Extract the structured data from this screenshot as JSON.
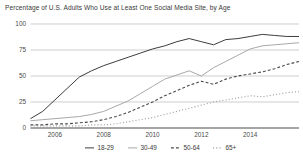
{
  "chart_data": {
    "type": "line",
    "title": "Percentage of U.S. Adults Who Use at Least One Social Media Site, by Age",
    "xlabel": "",
    "ylabel": "",
    "xlim": [
      2005,
      2016
    ],
    "ylim": [
      0,
      100
    ],
    "grid": true,
    "legend_position": "bottom",
    "ytick_labels": [
      "0",
      "25",
      "50",
      "75",
      "100"
    ],
    "ytick_values": [
      0,
      25,
      50,
      75,
      100
    ],
    "xtick_labels": [
      "2006",
      "2008",
      "2010",
      "2012",
      "2014"
    ],
    "xtick_values": [
      2006,
      2008,
      2010,
      2012,
      2014
    ],
    "x": [
      2005.0,
      2005.5,
      2006.0,
      2006.5,
      2007.0,
      2007.5,
      2008.0,
      2008.5,
      2009.0,
      2009.5,
      2010.0,
      2010.5,
      2011.0,
      2011.5,
      2012.0,
      2012.5,
      2013.0,
      2013.5,
      2014.0,
      2014.5,
      2015.0,
      2015.5,
      2016.0
    ],
    "series": [
      {
        "name": "18-29",
        "color": "#3d3d3d",
        "style": "solid",
        "values": [
          9,
          16,
          27,
          38,
          49,
          55,
          60,
          64,
          68,
          72,
          76,
          79,
          83,
          86,
          83,
          80,
          85,
          86,
          88,
          90,
          89,
          88,
          88
        ]
      },
      {
        "name": "30-49",
        "color": "#a8a8a8",
        "style": "solid",
        "values": [
          7,
          8,
          9,
          10,
          11,
          13,
          16,
          21,
          26,
          33,
          40,
          47,
          51,
          55,
          50,
          58,
          64,
          70,
          76,
          79,
          80,
          81,
          82
        ]
      },
      {
        "name": "50-64",
        "color": "#4a4a4a",
        "style": "dashed",
        "values": [
          3,
          3,
          4,
          4,
          5,
          6,
          8,
          11,
          15,
          20,
          25,
          31,
          36,
          41,
          45,
          42,
          47,
          50,
          52,
          54,
          57,
          61,
          64
        ]
      },
      {
        "name": "65+",
        "color": "#a0a0a0",
        "style": "dotted",
        "values": [
          2,
          2,
          2,
          2,
          2,
          3,
          3,
          4,
          6,
          8,
          10,
          13,
          16,
          19,
          22,
          25,
          27,
          29,
          31,
          30,
          32,
          34,
          35
        ]
      }
    ]
  },
  "legend": {
    "items": [
      {
        "label": "18-29"
      },
      {
        "label": "30-49"
      },
      {
        "label": "50-64"
      },
      {
        "label": "65+"
      }
    ]
  }
}
